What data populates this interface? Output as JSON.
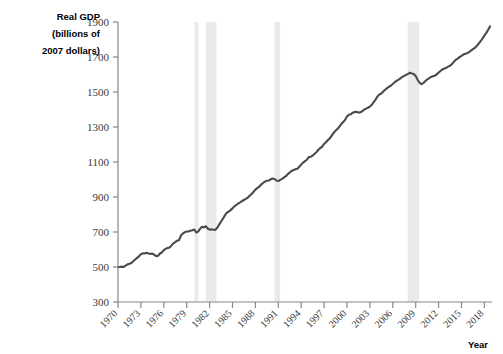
{
  "chart_data": {
    "type": "line",
    "title": "",
    "ylabel": "Real GDP (billions of 2007 dollars)",
    "ylabel_lines": [
      "Real GDP",
      "(billions of",
      "2007 dollars)"
    ],
    "xlabel": "Year",
    "ylim": [
      300,
      1900
    ],
    "xlim": [
      1970,
      2019
    ],
    "grid": false,
    "legend": "none",
    "y_ticks": [
      300,
      500,
      700,
      900,
      1100,
      1300,
      1500,
      1700,
      1900
    ],
    "x_ticks": [
      1970,
      1973,
      1976,
      1979,
      1982,
      1985,
      1988,
      1991,
      1994,
      1997,
      2000,
      2003,
      2006,
      2009,
      2012,
      2015,
      2018
    ],
    "line_color": "#4a4a4a",
    "recession_band_color": "#eaeaea",
    "recession_bands": [
      {
        "start": 1980.0,
        "end": 1980.55,
        "label": "1980 recession"
      },
      {
        "start": 1981.5,
        "end": 1982.9,
        "label": "1981-82 recession"
      },
      {
        "start": 1990.5,
        "end": 1991.25,
        "label": "1990-91 recession"
      },
      {
        "start": 2007.95,
        "end": 2009.45,
        "label": "2008-09 recession"
      }
    ],
    "series": [
      {
        "name": "Real GDP",
        "x": [
          1970.0,
          1970.25,
          1970.5,
          1970.75,
          1971.0,
          1971.25,
          1971.5,
          1971.75,
          1972.0,
          1972.25,
          1972.5,
          1972.75,
          1973.0,
          1973.25,
          1973.5,
          1973.75,
          1974.0,
          1974.25,
          1974.5,
          1974.75,
          1975.0,
          1975.25,
          1975.5,
          1975.75,
          1976.0,
          1976.25,
          1976.5,
          1976.75,
          1977.0,
          1977.25,
          1977.5,
          1977.75,
          1978.0,
          1978.25,
          1978.5,
          1978.75,
          1979.0,
          1979.25,
          1979.5,
          1979.75,
          1980.0,
          1980.25,
          1980.5,
          1980.75,
          1981.0,
          1981.25,
          1981.5,
          1981.75,
          1982.0,
          1982.25,
          1982.5,
          1982.75,
          1983.0,
          1983.25,
          1983.5,
          1983.75,
          1984.0,
          1984.25,
          1984.5,
          1984.75,
          1985.0,
          1985.25,
          1985.5,
          1985.75,
          1986.0,
          1986.25,
          1986.5,
          1986.75,
          1987.0,
          1987.25,
          1987.5,
          1987.75,
          1988.0,
          1988.25,
          1988.5,
          1988.75,
          1989.0,
          1989.25,
          1989.5,
          1989.75,
          1990.0,
          1990.25,
          1990.5,
          1990.75,
          1991.0,
          1991.25,
          1991.5,
          1991.75,
          1992.0,
          1992.25,
          1992.5,
          1992.75,
          1993.0,
          1993.25,
          1993.5,
          1993.75,
          1994.0,
          1994.25,
          1994.5,
          1994.75,
          1995.0,
          1995.25,
          1995.5,
          1995.75,
          1996.0,
          1996.25,
          1996.5,
          1996.75,
          1997.0,
          1997.25,
          1997.5,
          1997.75,
          1998.0,
          1998.25,
          1998.5,
          1998.75,
          1999.0,
          1999.25,
          1999.5,
          1999.75,
          2000.0,
          2000.25,
          2000.5,
          2000.75,
          2001.0,
          2001.25,
          2001.5,
          2001.75,
          2002.0,
          2002.25,
          2002.5,
          2002.75,
          2003.0,
          2003.25,
          2003.5,
          2003.75,
          2004.0,
          2004.25,
          2004.5,
          2004.75,
          2005.0,
          2005.25,
          2005.5,
          2005.75,
          2006.0,
          2006.25,
          2006.5,
          2006.75,
          2007.0,
          2007.25,
          2007.5,
          2007.75,
          2008.0,
          2008.25,
          2008.5,
          2008.75,
          2009.0,
          2009.25,
          2009.5,
          2009.75,
          2010.0,
          2010.25,
          2010.5,
          2010.75,
          2011.0,
          2011.25,
          2011.5,
          2011.75,
          2012.0,
          2012.25,
          2012.5,
          2012.75,
          2013.0,
          2013.25,
          2013.5,
          2013.75,
          2014.0,
          2014.25,
          2014.5,
          2014.75,
          2015.0,
          2015.25,
          2015.5,
          2015.75,
          2016.0,
          2016.25,
          2016.5,
          2016.75,
          2017.0,
          2017.25,
          2017.5,
          2017.75,
          2018.0,
          2018.25,
          2018.5,
          2018.75
        ],
        "y": [
          500,
          500,
          502,
          500,
          508,
          515,
          518,
          523,
          533,
          543,
          552,
          561,
          573,
          578,
          577,
          581,
          577,
          575,
          577,
          570,
          562,
          564,
          577,
          583,
          597,
          604,
          608,
          612,
          622,
          635,
          642,
          651,
          653,
          680,
          691,
          699,
          703,
          703,
          708,
          710,
          714,
          697,
          702,
          718,
          730,
          726,
          733,
          720,
          713,
          716,
          713,
          712,
          724,
          742,
          760,
          776,
          795,
          810,
          817,
          825,
          835,
          847,
          855,
          863,
          869,
          877,
          883,
          889,
          896,
          907,
          917,
          929,
          942,
          951,
          959,
          971,
          980,
          988,
          993,
          994,
          1001,
          1006,
          1003,
          994,
          991,
          998,
          1004,
          1012,
          1019,
          1031,
          1040,
          1049,
          1054,
          1058,
          1062,
          1073,
          1085,
          1097,
          1105,
          1113,
          1128,
          1130,
          1136,
          1147,
          1156,
          1170,
          1179,
          1188,
          1203,
          1213,
          1226,
          1235,
          1251,
          1266,
          1279,
          1289,
          1301,
          1317,
          1328,
          1341,
          1360,
          1370,
          1373,
          1382,
          1385,
          1387,
          1382,
          1384,
          1390,
          1399,
          1405,
          1410,
          1417,
          1427,
          1442,
          1457,
          1475,
          1486,
          1491,
          1503,
          1513,
          1522,
          1530,
          1537,
          1546,
          1556,
          1564,
          1570,
          1578,
          1586,
          1592,
          1598,
          1604,
          1610,
          1606,
          1603,
          1592,
          1570,
          1553,
          1545,
          1551,
          1562,
          1572,
          1578,
          1586,
          1590,
          1593,
          1600,
          1611,
          1620,
          1629,
          1634,
          1638,
          1645,
          1650,
          1659,
          1672,
          1684,
          1691,
          1699,
          1706,
          1714,
          1718,
          1722,
          1728,
          1737,
          1745,
          1752,
          1763,
          1776,
          1790,
          1805,
          1822,
          1838,
          1856,
          1875
        ]
      }
    ]
  }
}
